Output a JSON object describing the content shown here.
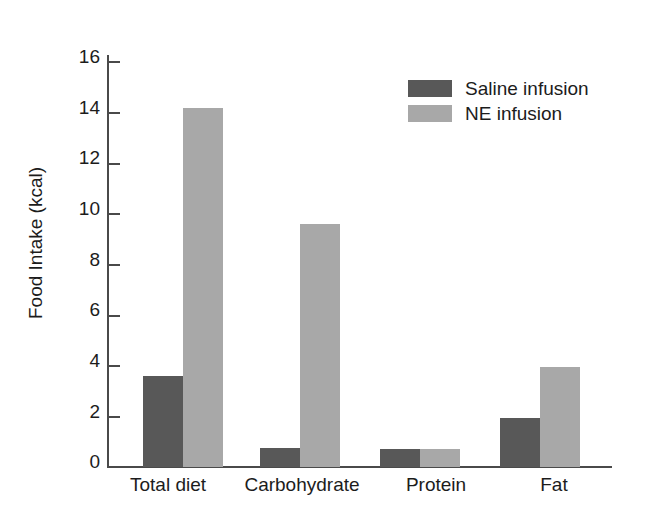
{
  "chart_data": {
    "type": "bar",
    "title": "",
    "subtitle": "",
    "xlabel": "",
    "ylabel": "Food Intake (kcal)",
    "categories": [
      "Total diet",
      "Carbohydrate",
      "Protein",
      "Fat"
    ],
    "series": [
      {
        "name": "Saline infusion",
        "color": "#585858",
        "values": [
          3.6,
          0.75,
          0.7,
          1.95
        ]
      },
      {
        "name": "NE infusion",
        "color": "#a8a8a8",
        "values": [
          14.2,
          9.6,
          0.7,
          3.95
        ]
      }
    ],
    "ylim": [
      0,
      17
    ],
    "yticks": [
      0,
      2,
      4,
      6,
      8,
      10,
      12,
      14,
      16
    ],
    "ytick_labels": [
      "0",
      "2",
      "4",
      "6",
      "8",
      "10",
      "12",
      "14",
      "16"
    ],
    "grid": false,
    "legend_position": "top-right",
    "bar_grouping": "adjacent-pairs",
    "background_color": "#ffffff",
    "axis_color": "#4a4a4a",
    "text_color": "#1c1c1c"
  },
  "axes": {
    "y_title": "Food Intake (kcal)",
    "y_tick_labels": [
      "16",
      "14",
      "12",
      "10",
      "8",
      "6",
      "4",
      "2",
      "0"
    ]
  },
  "legend": {
    "items": [
      {
        "label": "Saline infusion",
        "color": "#585858"
      },
      {
        "label": "NE infusion",
        "color": "#a8a8a8"
      }
    ]
  },
  "groups": [
    {
      "label": "Total diet"
    },
    {
      "label": "Carbohydrate"
    },
    {
      "label": "Protein"
    },
    {
      "label": "Fat"
    }
  ]
}
